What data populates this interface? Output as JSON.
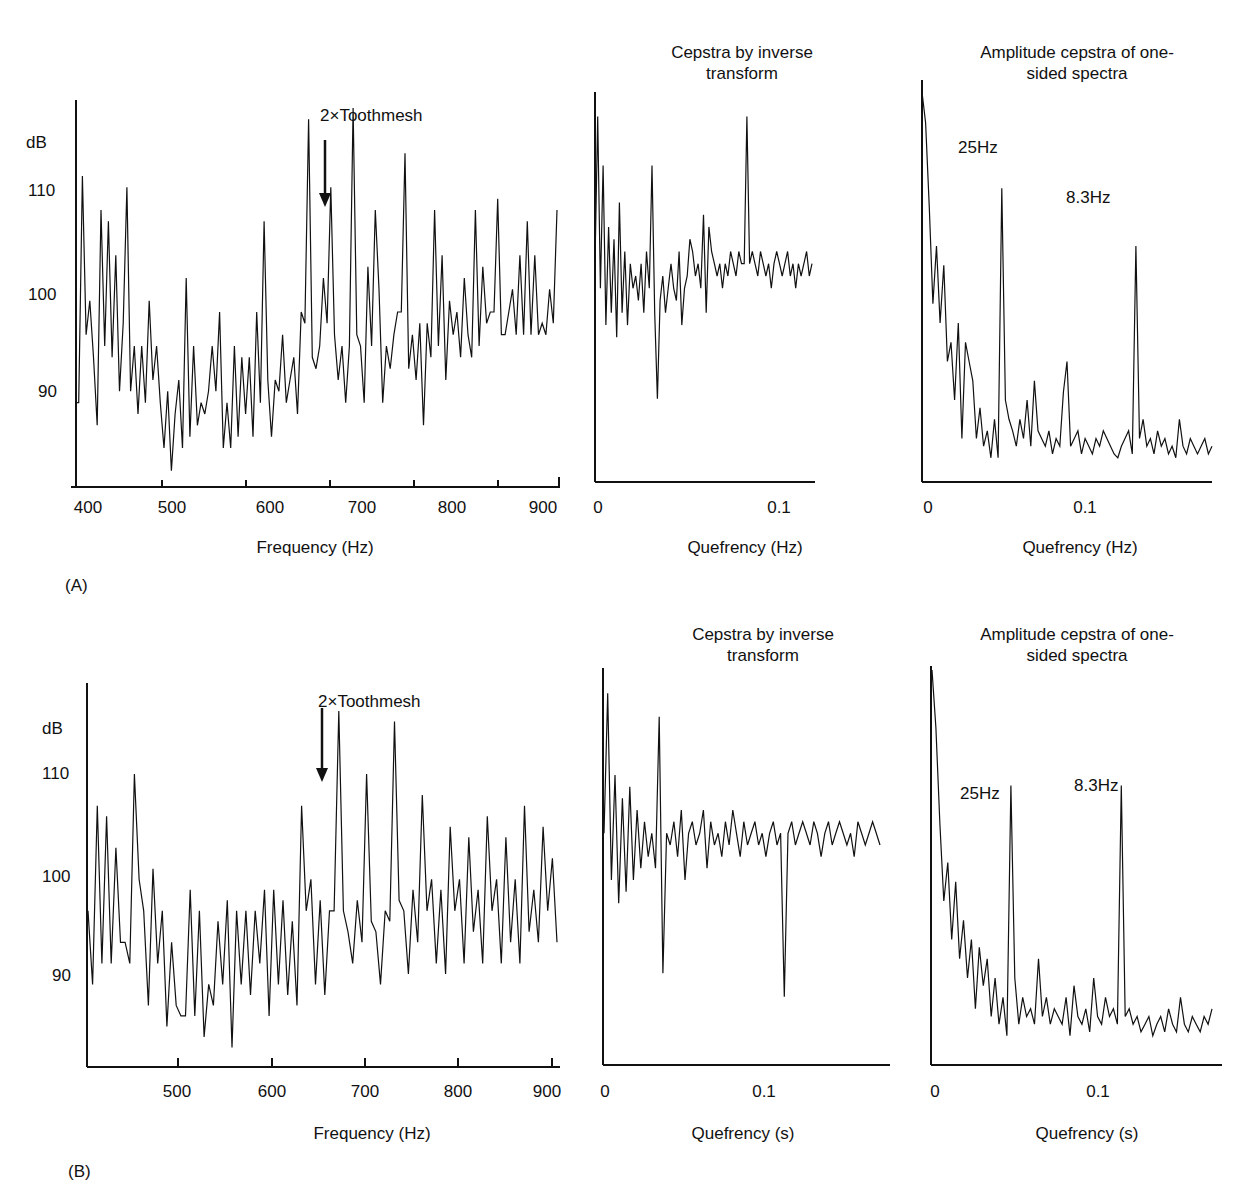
{
  "panels": [
    {
      "label": "(A)"
    },
    {
      "label": "(B)"
    }
  ],
  "chart_data": [
    {
      "panel": "A",
      "type": "line",
      "title": "",
      "xlabel": "Frequency (Hz)",
      "ylabel": "dB",
      "xticks": [
        "400",
        "500",
        "600",
        "700",
        "800",
        "900"
      ],
      "yticks": [
        "90",
        "100",
        "110"
      ],
      "xlim": [
        400,
        900
      ],
      "ylim": [
        81,
        114
      ],
      "annotation": "2×Toothmesh",
      "annotation_x": 657,
      "series": [
        {
          "name": "spectrum",
          "x_range": [
            400,
            900
          ],
          "values": [
            88,
            88,
            108,
            94,
            97,
            92,
            86,
            105,
            93,
            104,
            92,
            101,
            89,
            95,
            107,
            89,
            93,
            87,
            93,
            88,
            97,
            90,
            93,
            88,
            84,
            89,
            82,
            87,
            90,
            84,
            99,
            85,
            93,
            86,
            88,
            87,
            89,
            93,
            89,
            96,
            84,
            88,
            84,
            93,
            85,
            92,
            87,
            92,
            85,
            96,
            88,
            104,
            90,
            85,
            90,
            89,
            94,
            88,
            90,
            92,
            87,
            96,
            95,
            113,
            92,
            91,
            93,
            99,
            95,
            107,
            94,
            90,
            93,
            88,
            93,
            114,
            94,
            93,
            88,
            100,
            93,
            105,
            98,
            88,
            93,
            91,
            94,
            96,
            96,
            110,
            91,
            94,
            90,
            95,
            86,
            95,
            92,
            105,
            93,
            101,
            90,
            97,
            94,
            96,
            92,
            99,
            94,
            92,
            105,
            93,
            100,
            95,
            96,
            96,
            106,
            94,
            94,
            96,
            98,
            94,
            101,
            94,
            104,
            94,
            101,
            94,
            95,
            94,
            98,
            95,
            105
          ]
        }
      ]
    },
    {
      "panel": "A",
      "type": "line",
      "title": "Cepstra by inverse transform",
      "xlabel": "Quefrency (Hz)",
      "ylabel": "",
      "xticks": [
        "0",
        "0.1"
      ],
      "series": [
        {
          "name": "cepstrum",
          "x_range": [
            0,
            0.18
          ],
          "values": [
            100,
            112,
            98,
            108,
            95,
            103,
            96,
            102,
            94,
            105,
            96,
            101,
            95,
            100,
            98,
            99,
            97,
            100,
            96,
            101,
            98,
            108,
            96,
            89,
            97,
            99,
            96,
            98,
            100,
            98,
            97,
            101,
            95,
            98,
            99,
            102,
            101,
            99,
            100,
            98,
            104,
            96,
            103,
            101,
            100,
            99,
            100,
            98,
            100,
            99,
            101,
            100,
            99,
            101,
            100,
            100,
            112,
            100,
            101,
            100,
            99,
            101,
            100,
            99,
            100,
            98,
            100,
            101,
            100,
            99,
            100,
            101,
            99,
            100,
            98,
            100,
            99,
            100,
            101,
            99,
            100
          ]
        }
      ]
    },
    {
      "panel": "A",
      "type": "line",
      "title": "Amplitude cepstra of one-sided spectra",
      "xlabel": "Quefrency (Hz)",
      "ylabel": "",
      "xticks": [
        "0",
        "0.1"
      ],
      "annotations": [
        {
          "text": "25Hz",
          "x": 0.033
        },
        {
          "text": "8.3Hz",
          "x": 0.11
        }
      ],
      "series": [
        {
          "name": "amplitude cepstrum",
          "x_range": [
            0,
            0.18
          ],
          "values": [
            100,
            92,
            70,
            45,
            60,
            40,
            55,
            30,
            35,
            20,
            40,
            10,
            35,
            30,
            25,
            10,
            18,
            8,
            12,
            5,
            15,
            5,
            75,
            20,
            15,
            12,
            8,
            15,
            10,
            20,
            8,
            25,
            12,
            10,
            8,
            12,
            6,
            10,
            8,
            22,
            30,
            8,
            10,
            12,
            6,
            10,
            8,
            6,
            10,
            8,
            12,
            10,
            8,
            6,
            5,
            8,
            10,
            12,
            6,
            60,
            10,
            15,
            8,
            10,
            6,
            12,
            8,
            10,
            6,
            8,
            5,
            15,
            8,
            6,
            10,
            8,
            6,
            8,
            10,
            6,
            8
          ]
        }
      ]
    },
    {
      "panel": "B",
      "type": "line",
      "title": "",
      "xlabel": "Frequency (Hz)",
      "ylabel": "dB",
      "xticks": [
        "500",
        "600",
        "700",
        "800",
        "900"
      ],
      "yticks": [
        "90",
        "100",
        "110"
      ],
      "xlim": [
        405,
        915
      ],
      "ylim": [
        81,
        116
      ],
      "annotation": "2×Toothmesh",
      "annotation_x": 657,
      "series": [
        {
          "name": "spectrum",
          "x_range": [
            405,
            915
          ],
          "values": [
            95,
            88,
            105,
            90,
            104,
            90,
            101,
            92,
            92,
            90,
            108,
            98,
            95,
            86,
            99,
            90,
            95,
            84,
            92,
            86,
            85,
            85,
            97,
            85,
            95,
            83,
            88,
            86,
            94,
            88,
            96,
            82,
            95,
            88,
            95,
            87,
            95,
            90,
            97,
            85,
            97,
            88,
            96,
            87,
            94,
            86,
            105,
            95,
            98,
            88,
            96,
            87,
            95,
            95,
            114,
            95,
            93,
            90,
            96,
            92,
            108,
            94,
            93,
            88,
            95,
            94,
            113,
            96,
            95,
            89,
            97,
            92,
            106,
            95,
            98,
            90,
            97,
            89,
            103,
            95,
            98,
            90,
            102,
            93,
            97,
            90,
            104,
            95,
            98,
            90,
            102,
            92,
            98,
            90,
            105,
            93,
            97,
            92,
            103,
            95,
            100,
            92
          ]
        }
      ]
    },
    {
      "panel": "B",
      "type": "line",
      "title": "Cepstra by inverse transform",
      "xlabel": "Quefrency (s)",
      "ylabel": "",
      "xticks": [
        "0",
        "0.1"
      ],
      "series": [
        {
          "name": "cepstrum",
          "x_range": [
            0,
            0.18
          ],
          "values": [
            100,
            112,
            96,
            105,
            94,
            103,
            95,
            104,
            96,
            102,
            97,
            101,
            98,
            100,
            97,
            110,
            88,
            100,
            99,
            101,
            98,
            102,
            96,
            100,
            101,
            99,
            100,
            102,
            97,
            101,
            99,
            100,
            98,
            101,
            99,
            102,
            100,
            98,
            101,
            99,
            100,
            101,
            99,
            100,
            98,
            100,
            101,
            99,
            100,
            86,
            100,
            101,
            99,
            100,
            101,
            100,
            99,
            101,
            100,
            98,
            100,
            101,
            99,
            100,
            101,
            100,
            99,
            100,
            98,
            101,
            100,
            99,
            100,
            101,
            100,
            99
          ]
        }
      ]
    },
    {
      "panel": "B",
      "type": "line",
      "title": "Amplitude cepstra of one-sided spectra",
      "xlabel": "Quefrency (s)",
      "ylabel": "",
      "xticks": [
        "0",
        "0.1"
      ],
      "annotations": [
        {
          "text": "25Hz",
          "x": 0.033
        },
        {
          "text": "8.3Hz",
          "x": 0.11
        }
      ],
      "series": [
        {
          "name": "amplitude cepstrum",
          "x_range": [
            0,
            0.18
          ],
          "values": [
            100,
            85,
            60,
            40,
            50,
            30,
            45,
            25,
            35,
            20,
            30,
            12,
            28,
            18,
            25,
            10,
            20,
            8,
            15,
            5,
            70,
            20,
            8,
            15,
            10,
            12,
            8,
            25,
            10,
            15,
            8,
            12,
            10,
            8,
            15,
            5,
            18,
            10,
            8,
            12,
            6,
            20,
            10,
            8,
            15,
            10,
            12,
            8,
            70,
            10,
            12,
            8,
            10,
            6,
            8,
            10,
            5,
            8,
            10,
            6,
            12,
            8,
            6,
            15,
            8,
            6,
            10,
            8,
            6,
            10,
            8,
            12
          ]
        }
      ]
    }
  ]
}
